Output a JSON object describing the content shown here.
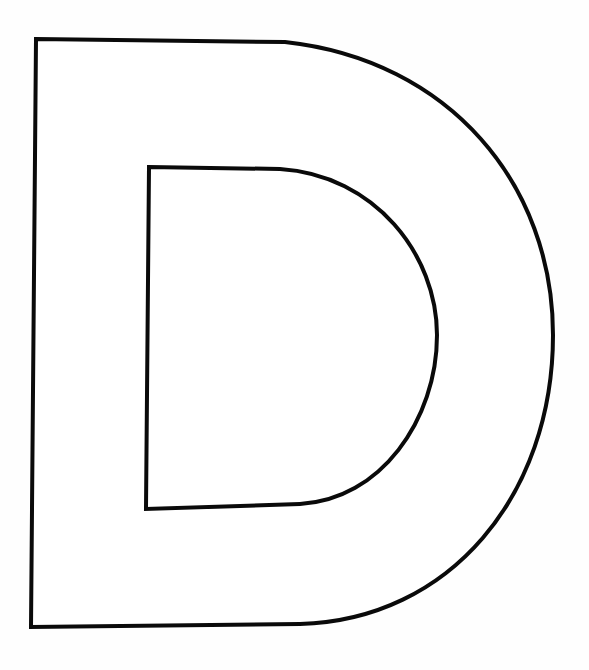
{
  "figure": {
    "letter": "D",
    "style": "outline",
    "stroke_color": "#0a0a0a",
    "fill_color": "#ffffff",
    "background_color": "#fefefe",
    "stroke_width": 4
  }
}
